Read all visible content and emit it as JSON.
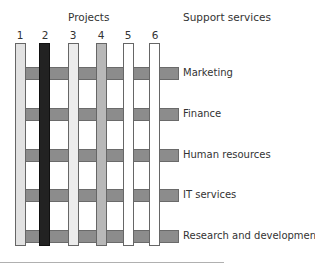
{
  "diagram": {
    "title_left": "Projects",
    "title_right": "Support services",
    "projects": [
      {
        "label": "1",
        "color": "#e2e2e2"
      },
      {
        "label": "2",
        "color": "#222222"
      },
      {
        "label": "3",
        "color": "#ececec"
      },
      {
        "label": "4",
        "color": "#b8b8b8"
      },
      {
        "label": "5",
        "color": "#ffffff"
      },
      {
        "label": "6",
        "color": "#ffffff"
      }
    ],
    "support_services": [
      {
        "label": "Marketing"
      },
      {
        "label": "Finance"
      },
      {
        "label": "Human resources"
      },
      {
        "label": "IT services"
      },
      {
        "label": "Research and development"
      }
    ],
    "service_bar_color": "#8c8c8c"
  }
}
